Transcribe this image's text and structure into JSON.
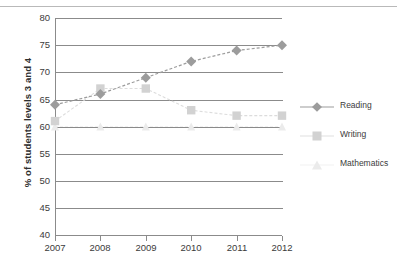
{
  "chart_data": {
    "type": "line",
    "title": "",
    "subtitle": "",
    "xlabel": "",
    "ylabel": "% of students levels 3 and 4",
    "x": [
      2007,
      2008,
      2009,
      2010,
      2011,
      2012
    ],
    "categories": [
      "2007",
      "2008",
      "2009",
      "2010",
      "2011",
      "2012"
    ],
    "xtick_labels": [
      "2007",
      "2008",
      "2009",
      "2010",
      "2011",
      "2012"
    ],
    "ytick_labels": [
      "80",
      "75",
      "70",
      "65",
      "60",
      "55",
      "50",
      "45",
      "40"
    ],
    "yticks": [
      80,
      75,
      70,
      65,
      60,
      55,
      50,
      45,
      40
    ],
    "ylim": [
      40,
      80
    ],
    "xlim": [
      2007,
      2012
    ],
    "grid": "horizontal",
    "legend_position": "right",
    "series": [
      {
        "name": "Reading",
        "marker": "diamond",
        "color": "#9c9c9c",
        "values": [
          64,
          66,
          69,
          72,
          74,
          75
        ]
      },
      {
        "name": "Writing",
        "marker": "square",
        "color": "#d2d2d2",
        "values": [
          61,
          67,
          67,
          63,
          62,
          62
        ]
      },
      {
        "name": "Mathematics",
        "marker": "triangle",
        "color": "#ebebeb",
        "values": [
          60,
          60,
          60,
          60,
          60,
          60
        ]
      }
    ],
    "legend_entries": [
      "Reading",
      "Writing",
      "Mathematics"
    ]
  },
  "colors": {
    "axis": "#8b8b8b",
    "text": "#3b3b3b",
    "reading": "#9c9c9c",
    "writing": "#d2d2d2",
    "mathematics": "#ebebeb",
    "background": "#ffffff"
  }
}
